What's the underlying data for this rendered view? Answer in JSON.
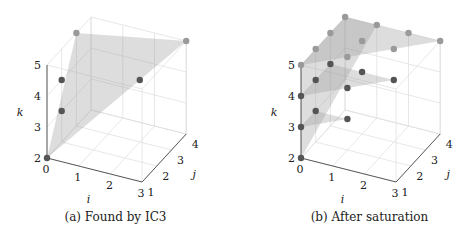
{
  "chart_data": [
    {
      "type": "scatter3d",
      "title": "",
      "caption": "(a) Found by IC3",
      "xlabel": "i",
      "ylabel": "j",
      "zlabel": "k",
      "x_ticks": [
        "0",
        "1",
        "2",
        "3"
      ],
      "y_ticks": [
        "1",
        "2",
        "3",
        "4"
      ],
      "z_ticks": [
        "2",
        "3",
        "4",
        "5"
      ],
      "xlim": [
        0,
        3
      ],
      "ylim": [
        1,
        4
      ],
      "zlim": [
        2,
        5
      ],
      "grid": true,
      "points": [
        {
          "i": 0,
          "j": 1,
          "k": 2,
          "shade": "dark"
        },
        {
          "i": 0,
          "j": 2,
          "k": 3,
          "shade": "dark"
        },
        {
          "i": 0,
          "j": 2,
          "k": 4,
          "shade": "dark"
        },
        {
          "i": 2,
          "j": 3,
          "k": 4,
          "shade": "dark"
        },
        {
          "i": 0,
          "j": 3,
          "k": 5,
          "shade": "light"
        },
        {
          "i": 3,
          "j": 4,
          "k": 5,
          "shade": "light"
        }
      ],
      "planes": [
        [
          [
            0,
            1,
            2
          ],
          [
            0,
            3,
            5
          ],
          [
            3,
            4,
            5
          ]
        ]
      ]
    },
    {
      "type": "scatter3d",
      "title": "",
      "caption": "(b) After saturation",
      "xlabel": "i",
      "ylabel": "j",
      "zlabel": "k",
      "x_ticks": [
        "0",
        "1",
        "2",
        "3"
      ],
      "y_ticks": [
        "1",
        "2",
        "3",
        "4"
      ],
      "z_ticks": [
        "2",
        "3",
        "4",
        "5"
      ],
      "xlim": [
        0,
        3
      ],
      "ylim": [
        1,
        4
      ],
      "zlim": [
        2,
        5
      ],
      "grid": true,
      "points": [
        {
          "i": 0,
          "j": 1,
          "k": 2,
          "shade": "dark"
        },
        {
          "i": 0,
          "j": 1,
          "k": 3,
          "shade": "dark"
        },
        {
          "i": 0,
          "j": 2,
          "k": 3,
          "shade": "dark"
        },
        {
          "i": 1,
          "j": 2,
          "k": 3,
          "shade": "dark"
        },
        {
          "i": 0,
          "j": 1,
          "k": 4,
          "shade": "dark"
        },
        {
          "i": 0,
          "j": 2,
          "k": 4,
          "shade": "dark"
        },
        {
          "i": 0,
          "j": 3,
          "k": 4,
          "shade": "dark"
        },
        {
          "i": 1,
          "j": 2,
          "k": 4,
          "shade": "dark"
        },
        {
          "i": 1,
          "j": 3,
          "k": 4,
          "shade": "dark"
        },
        {
          "i": 2,
          "j": 3,
          "k": 4,
          "shade": "dark"
        },
        {
          "i": 0,
          "j": 1,
          "k": 5,
          "shade": "light"
        },
        {
          "i": 0,
          "j": 2,
          "k": 5,
          "shade": "light"
        },
        {
          "i": 0,
          "j": 3,
          "k": 5,
          "shade": "light"
        },
        {
          "i": 0,
          "j": 4,
          "k": 5,
          "shade": "light"
        },
        {
          "i": 1,
          "j": 2,
          "k": 5,
          "shade": "light"
        },
        {
          "i": 1,
          "j": 3,
          "k": 5,
          "shade": "light"
        },
        {
          "i": 1,
          "j": 4,
          "k": 5,
          "shade": "light"
        },
        {
          "i": 2,
          "j": 3,
          "k": 5,
          "shade": "light"
        },
        {
          "i": 2,
          "j": 4,
          "k": 5,
          "shade": "light"
        },
        {
          "i": 3,
          "j": 4,
          "k": 5,
          "shade": "light"
        }
      ],
      "planes": [
        [
          [
            0,
            1,
            2
          ],
          [
            0,
            1,
            5
          ],
          [
            0,
            4,
            5
          ]
        ],
        [
          [
            0,
            1,
            2
          ],
          [
            0,
            4,
            5
          ],
          [
            1,
            4,
            5
          ]
        ],
        [
          [
            0,
            1,
            3
          ],
          [
            1,
            2,
            3
          ],
          [
            0,
            2,
            3
          ]
        ],
        [
          [
            0,
            1,
            4
          ],
          [
            2,
            3,
            4
          ],
          [
            0,
            3,
            4
          ]
        ],
        [
          [
            0,
            1,
            5
          ],
          [
            0,
            4,
            5
          ],
          [
            3,
            4,
            5
          ]
        ]
      ]
    }
  ],
  "colors": {
    "dark_point": "#555555",
    "light_point": "#9a9a9a",
    "plane_fill": "#9e9e9e",
    "grid": "#dddddd",
    "axis": "#333333"
  }
}
